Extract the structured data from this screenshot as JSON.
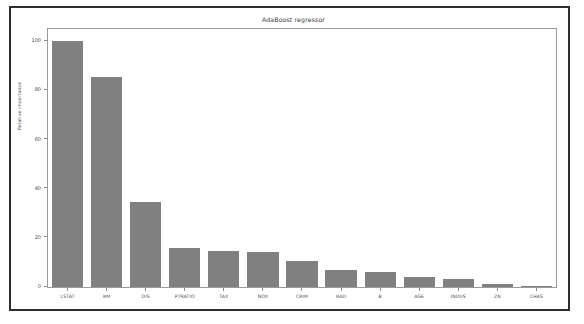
{
  "window": {
    "background": "#ffffff",
    "border_color": "#2e2e2e"
  },
  "chart_data": {
    "type": "bar",
    "title": "AdaBoost regressor",
    "xlabel": "",
    "ylabel": "Relative importance",
    "categories": [
      "LSTAT",
      "RM",
      "DIS",
      "PTRATIO",
      "TAX",
      "NOX",
      "CRIM",
      "RAD",
      "B",
      "AGE",
      "INDUS",
      "ZN",
      "CHAS"
    ],
    "values": [
      100.0,
      85.5,
      34.5,
      16.0,
      14.5,
      14.3,
      10.5,
      7.0,
      6.0,
      4.0,
      3.4,
      1.2,
      0.5
    ],
    "ylim": [
      0,
      105
    ],
    "yticks": [
      0,
      20,
      40,
      60,
      80,
      100
    ],
    "ytick_labels": [
      "0",
      "20",
      "40",
      "60",
      "80",
      "100"
    ],
    "grid": false,
    "legend": null,
    "bar_color": "#808080",
    "axis_color": "#9a9a9a",
    "text_color": "#4a4a4a"
  }
}
